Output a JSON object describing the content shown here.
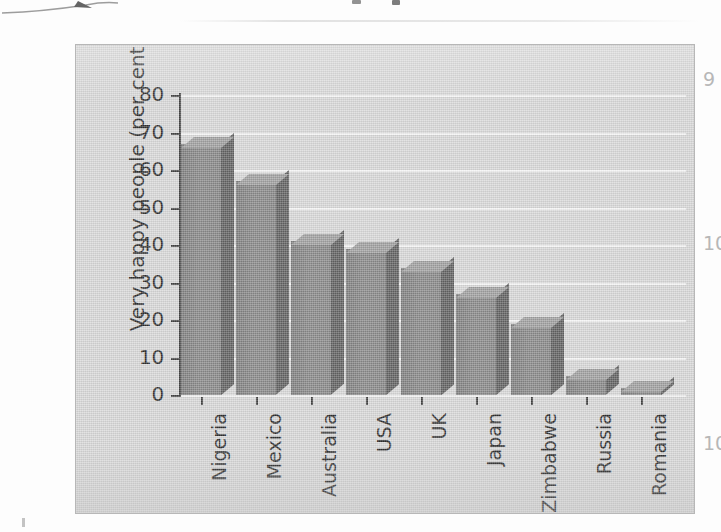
{
  "chart_data": {
    "type": "bar",
    "title": "",
    "subtitle": "",
    "xlabel": "",
    "ylabel": "Very happy people (per cent)",
    "categories": [
      "Nigeria",
      "Mexico",
      "Australia",
      "USA",
      "UK",
      "Japan",
      "Zimbabwe",
      "Russia",
      "Romania"
    ],
    "values": [
      67,
      57,
      41,
      39,
      34,
      27,
      19,
      5,
      2
    ],
    "ylim": [
      0,
      80
    ],
    "ytick_labels": [
      "80",
      "70",
      "60",
      "50",
      "40",
      "30",
      "20",
      "10",
      "0"
    ],
    "ytick_values": [
      80,
      70,
      60,
      50,
      40,
      30,
      20,
      10,
      0
    ],
    "ytick_step": 10,
    "grid": "horizontal",
    "legend": "none",
    "style": "3d-columns",
    "annotations": []
  },
  "figure": {
    "plot_background_color": "#d4d4d4",
    "gridline_color": "#f4f4f4",
    "bar_front_color": "#767676",
    "bar_side_color": "#4d4d4d",
    "bar_top_color": "#949494",
    "axis_color": "#2a2a2a",
    "text_color": "#111111",
    "page_background_color": "#fdfdfd"
  },
  "page_margin": {
    "numbers": [
      "9",
      "10",
      "10"
    ]
  }
}
